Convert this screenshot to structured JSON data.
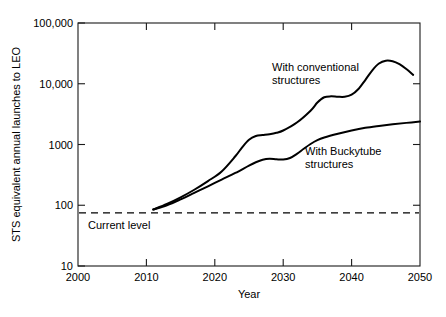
{
  "chart_data": {
    "type": "line",
    "title": "",
    "subtitle": "",
    "xlabel": "Year",
    "ylabel": "STS equivalent annual launches to LEO",
    "xlim": [
      2000,
      2050
    ],
    "ylim": [
      10,
      100000
    ],
    "yscale": "log",
    "xscale": "linear",
    "grid": false,
    "legend": "inline-annotations",
    "xticks": [
      2000,
      2010,
      2020,
      2030,
      2040,
      2050
    ],
    "xticklabels": [
      "2000",
      "2010",
      "2020",
      "2030",
      "2040",
      "2050"
    ],
    "yticks": [
      10,
      100,
      1000,
      10000,
      100000
    ],
    "yticklabels": [
      "10",
      "100",
      "1000",
      "10,000",
      "100,000"
    ],
    "series": [
      {
        "name": "With conventional structures",
        "label": "With conventional",
        "label_line2": "structures",
        "x": [
          2011,
          2013,
          2015,
          2017,
          2019,
          2021,
          2023,
          2024,
          2025,
          2026,
          2027,
          2028,
          2029,
          2030,
          2032,
          2034,
          2035,
          2036,
          2037,
          2038,
          2039,
          2040,
          2041,
          2042,
          2043,
          2044,
          2045,
          2046,
          2047,
          2048,
          2049
        ],
        "values": [
          85,
          105,
          135,
          180,
          250,
          360,
          640,
          900,
          1200,
          1380,
          1430,
          1480,
          1560,
          1700,
          2300,
          3600,
          4900,
          6000,
          6200,
          6100,
          6100,
          6600,
          8200,
          11500,
          16500,
          21500,
          24000,
          23500,
          21000,
          17500,
          14000
        ]
      },
      {
        "name": "With Buckytube structures",
        "label": "With Buckytube",
        "label_line2": "structures",
        "x": [
          2011,
          2013,
          2015,
          2017,
          2019,
          2021,
          2023,
          2025,
          2026,
          2027,
          2028,
          2029,
          2030,
          2031,
          2032,
          2033,
          2034,
          2035,
          2036,
          2038,
          2040,
          2042,
          2044,
          2046,
          2048,
          2050
        ],
        "values": [
          85,
          100,
          125,
          160,
          205,
          265,
          340,
          450,
          510,
          560,
          580,
          570,
          565,
          600,
          700,
          850,
          1020,
          1180,
          1300,
          1500,
          1700,
          1880,
          2020,
          2150,
          2270,
          2380
        ]
      }
    ],
    "annotations": [
      {
        "name": "current-level",
        "text": "Current level",
        "type": "horizontal-reference-line",
        "value": 75,
        "style": "dashed"
      }
    ]
  },
  "axis": {
    "y_title": "STS equivalent annual launches to LEO",
    "x_title": "Year"
  },
  "labels": {
    "conventional_line1": "With conventional",
    "conventional_line2": "structures",
    "buckytube_line1": "With Buckytube",
    "buckytube_line2": "structures",
    "current_level": "Current level"
  },
  "ticks": {
    "y": [
      "100,000",
      "10,000",
      "1000",
      "100",
      "10"
    ],
    "x": [
      "2000",
      "2010",
      "2020",
      "2030",
      "2040",
      "2050"
    ]
  },
  "colors": {
    "background": "#ffffff",
    "line": "#000000",
    "axis": "#1a1a1a",
    "text": "#000000"
  }
}
